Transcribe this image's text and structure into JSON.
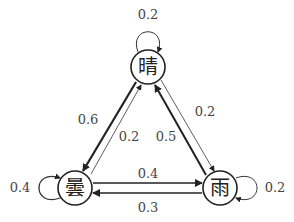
{
  "diagram": {
    "type": "markov-chain-state-transition",
    "nodes": [
      {
        "id": "sunny",
        "label": "晴",
        "x": 148,
        "y": 67
      },
      {
        "id": "cloudy",
        "label": "曇",
        "x": 75,
        "y": 188
      },
      {
        "id": "rainy",
        "label": "雨",
        "x": 220,
        "y": 188
      }
    ],
    "edges": [
      {
        "from": "sunny",
        "to": "sunny",
        "prob": "0.2"
      },
      {
        "from": "sunny",
        "to": "cloudy",
        "prob": "0.6"
      },
      {
        "from": "cloudy",
        "to": "sunny",
        "prob": "0.2"
      },
      {
        "from": "rainy",
        "to": "sunny",
        "prob": "0.5"
      },
      {
        "from": "sunny",
        "to": "rainy",
        "prob": "0.2"
      },
      {
        "from": "cloudy",
        "to": "rainy",
        "prob": "0.4"
      },
      {
        "from": "rainy",
        "to": "cloudy",
        "prob": "0.3"
      },
      {
        "from": "cloudy",
        "to": "cloudy",
        "prob": "0.4"
      },
      {
        "from": "rainy",
        "to": "rainy",
        "prob": "0.2"
      }
    ]
  }
}
